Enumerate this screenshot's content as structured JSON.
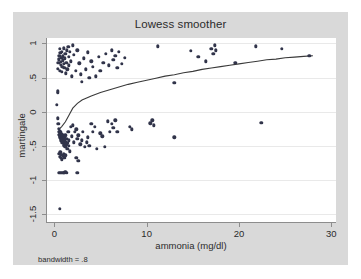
{
  "figure": {
    "title": "Lowess smoother",
    "note": "bandwidth = .8",
    "background_color": "#d9d9d9",
    "plot_background_color": "#ffffff",
    "marker_color": "#31344a",
    "line_color": "#3a3a3a"
  },
  "chart_data": {
    "type": "scatter",
    "title": "Lowess smoother",
    "xlabel": "ammonia (mg/dl)",
    "ylabel": "martingale",
    "annotation": "bandwidth = .8",
    "grid": true,
    "legend": "none",
    "xlim": [
      -0.9,
      30.5
    ],
    "ylim": [
      -1.62,
      1.08
    ],
    "xticks": [
      0,
      10,
      20,
      30
    ],
    "xtick_labels": [
      "0",
      "10",
      "20",
      "30"
    ],
    "yticks": [
      1,
      0.5,
      0,
      -0.5,
      -1,
      -1.5
    ],
    "ytick_labels": [
      "1",
      ".5",
      "0",
      "-.5",
      "-1",
      "-1.5"
    ],
    "series": [
      {
        "name": "martingale residuals",
        "type": "scatter",
        "points": [
          [
            0.35,
            0.3
          ],
          [
            0.4,
            0.63
          ],
          [
            0.45,
            0.72
          ],
          [
            0.5,
            0.77
          ],
          [
            0.55,
            0.82
          ],
          [
            0.6,
            0.6
          ],
          [
            0.62,
            0.92
          ],
          [
            0.65,
            0.86
          ],
          [
            0.7,
            0.69
          ],
          [
            0.72,
            0.73
          ],
          [
            0.75,
            0.79
          ],
          [
            0.8,
            0.88
          ],
          [
            0.82,
            0.58
          ],
          [
            0.85,
            0.66
          ],
          [
            0.9,
            0.75
          ],
          [
            0.95,
            0.81
          ],
          [
            1.0,
            0.93
          ],
          [
            1.05,
            0.7
          ],
          [
            1.1,
            0.64
          ],
          [
            1.15,
            0.78
          ],
          [
            1.2,
            0.85
          ],
          [
            1.25,
            0.56
          ],
          [
            1.3,
            0.72
          ],
          [
            1.35,
            0.9
          ],
          [
            1.4,
            0.62
          ],
          [
            1.5,
            0.95
          ],
          [
            1.55,
            0.8
          ],
          [
            1.6,
            0.68
          ],
          [
            1.7,
            0.88
          ],
          [
            1.8,
            0.74
          ],
          [
            1.9,
            0.52
          ],
          [
            2.0,
            0.97
          ],
          [
            2.1,
            0.83
          ],
          [
            2.3,
            0.6
          ],
          [
            2.5,
            0.9
          ],
          [
            2.7,
            0.71
          ],
          [
            2.9,
            0.55
          ],
          [
            3.0,
            0.44
          ],
          [
            3.2,
            0.78
          ],
          [
            3.4,
            0.62
          ],
          [
            3.6,
            0.87
          ],
          [
            3.8,
            0.5
          ],
          [
            4.0,
            0.74
          ],
          [
            4.2,
            0.66
          ],
          [
            4.5,
            0.52
          ],
          [
            4.8,
            0.8
          ],
          [
            5.0,
            0.6
          ],
          [
            5.3,
            0.72
          ],
          [
            5.6,
            0.85
          ],
          [
            5.9,
            0.68
          ],
          [
            6.2,
            0.9
          ],
          [
            6.4,
            0.76
          ],
          [
            6.6,
            0.82
          ],
          [
            6.8,
            0.64
          ],
          [
            7.0,
            0.88
          ],
          [
            7.3,
            0.7
          ],
          [
            7.6,
            0.79
          ],
          [
            11.2,
            0.96
          ],
          [
            13.0,
            0.42
          ],
          [
            14.8,
            0.89
          ],
          [
            15.6,
            0.8
          ],
          [
            16.4,
            0.74
          ],
          [
            17.0,
            0.92
          ],
          [
            17.2,
            0.85
          ],
          [
            17.4,
            0.97
          ],
          [
            17.5,
            0.9
          ],
          [
            19.6,
            0.72
          ],
          [
            21.8,
            0.96
          ],
          [
            24.6,
            0.92
          ],
          [
            27.6,
            0.82
          ],
          [
            0.3,
            0.1
          ],
          [
            0.35,
            0.28
          ],
          [
            0.4,
            -0.1
          ],
          [
            0.45,
            -0.18
          ],
          [
            0.5,
            -0.25
          ],
          [
            0.52,
            -0.3
          ],
          [
            0.55,
            -0.34
          ],
          [
            0.58,
            -0.28
          ],
          [
            0.6,
            -0.38
          ],
          [
            0.62,
            -0.32
          ],
          [
            0.65,
            -0.36
          ],
          [
            0.68,
            -0.42
          ],
          [
            0.7,
            -0.3
          ],
          [
            0.72,
            -0.35
          ],
          [
            0.75,
            -0.4
          ],
          [
            0.78,
            -0.33
          ],
          [
            0.8,
            -0.45
          ],
          [
            0.82,
            -0.37
          ],
          [
            0.85,
            -0.41
          ],
          [
            0.88,
            -0.34
          ],
          [
            0.9,
            -0.46
          ],
          [
            0.92,
            -0.39
          ],
          [
            0.95,
            -0.43
          ],
          [
            0.98,
            -0.36
          ],
          [
            1.0,
            -0.48
          ],
          [
            1.02,
            -0.4
          ],
          [
            1.05,
            -0.44
          ],
          [
            1.08,
            -0.38
          ],
          [
            1.1,
            -0.5
          ],
          [
            1.12,
            -0.42
          ],
          [
            1.15,
            -0.46
          ],
          [
            1.18,
            -0.35
          ],
          [
            1.2,
            -0.52
          ],
          [
            1.25,
            -0.44
          ],
          [
            1.3,
            -0.48
          ],
          [
            1.35,
            -0.4
          ],
          [
            1.4,
            -0.55
          ],
          [
            1.45,
            -0.46
          ],
          [
            1.5,
            -0.3
          ],
          [
            1.55,
            -0.5
          ],
          [
            1.6,
            -0.42
          ],
          [
            1.7,
            -0.58
          ],
          [
            1.8,
            -0.22
          ],
          [
            1.9,
            -0.36
          ],
          [
            2.0,
            -0.2
          ],
          [
            2.1,
            -0.45
          ],
          [
            2.2,
            -0.3
          ],
          [
            2.4,
            -0.26
          ],
          [
            2.5,
            -0.4
          ],
          [
            2.6,
            -0.35
          ],
          [
            2.8,
            -0.48
          ],
          [
            3.0,
            -0.42
          ],
          [
            3.1,
            -0.3
          ],
          [
            3.3,
            -0.52
          ],
          [
            3.5,
            -0.45
          ],
          [
            3.6,
            -0.38
          ],
          [
            3.8,
            -0.5
          ],
          [
            4.0,
            -0.18
          ],
          [
            4.2,
            -0.3
          ],
          [
            4.4,
            -0.22
          ],
          [
            4.6,
            -0.55
          ],
          [
            5.0,
            -0.32
          ],
          [
            5.2,
            -0.36
          ],
          [
            5.5,
            -0.52
          ],
          [
            5.8,
            -0.14
          ],
          [
            6.0,
            -0.3
          ],
          [
            6.2,
            -0.18
          ],
          [
            6.4,
            -0.24
          ],
          [
            6.6,
            -0.13
          ],
          [
            6.8,
            -0.3
          ],
          [
            8.2,
            -0.22
          ],
          [
            8.4,
            -0.26
          ],
          [
            10.4,
            -0.17
          ],
          [
            10.6,
            -0.13
          ],
          [
            10.8,
            -0.2
          ],
          [
            13.0,
            -0.38
          ],
          [
            22.4,
            -0.16
          ],
          [
            0.55,
            -0.62
          ],
          [
            0.6,
            -0.66
          ],
          [
            0.65,
            -0.6
          ],
          [
            0.7,
            -0.68
          ],
          [
            0.75,
            -0.63
          ],
          [
            0.8,
            -0.7
          ],
          [
            0.9,
            -0.65
          ],
          [
            1.0,
            -0.62
          ],
          [
            1.1,
            -0.68
          ],
          [
            1.2,
            -0.64
          ],
          [
            2.4,
            -0.68
          ],
          [
            2.6,
            -0.72
          ],
          [
            0.5,
            -0.9
          ],
          [
            0.6,
            -0.9
          ],
          [
            0.7,
            -0.9
          ],
          [
            0.8,
            -0.9
          ],
          [
            0.9,
            -0.9
          ],
          [
            1.0,
            -0.9
          ],
          [
            1.1,
            -0.9
          ],
          [
            1.2,
            -0.88
          ],
          [
            1.35,
            -0.9
          ],
          [
            2.5,
            -0.9
          ],
          [
            0.6,
            -1.43
          ]
        ]
      },
      {
        "name": "lowess smooth",
        "type": "line",
        "points": [
          [
            0.5,
            -0.26
          ],
          [
            0.8,
            -0.22
          ],
          [
            1.2,
            -0.15
          ],
          [
            1.6,
            -0.05
          ],
          [
            2.0,
            0.05
          ],
          [
            2.5,
            0.12
          ],
          [
            3.0,
            0.17
          ],
          [
            3.5,
            0.2
          ],
          [
            4.0,
            0.23
          ],
          [
            5.0,
            0.28
          ],
          [
            6.0,
            0.32
          ],
          [
            7.0,
            0.36
          ],
          [
            8.0,
            0.4
          ],
          [
            9.0,
            0.43
          ],
          [
            10.0,
            0.46
          ],
          [
            11.0,
            0.49
          ],
          [
            12.0,
            0.52
          ],
          [
            13.0,
            0.54
          ],
          [
            14.0,
            0.57
          ],
          [
            15.0,
            0.59
          ],
          [
            16.0,
            0.62
          ],
          [
            17.0,
            0.64
          ],
          [
            18.0,
            0.66
          ],
          [
            19.0,
            0.68
          ],
          [
            20.0,
            0.7
          ],
          [
            21.0,
            0.72
          ],
          [
            22.0,
            0.74
          ],
          [
            23.0,
            0.76
          ],
          [
            24.0,
            0.77
          ],
          [
            25.0,
            0.79
          ],
          [
            26.0,
            0.8
          ],
          [
            27.0,
            0.81
          ],
          [
            28.0,
            0.82
          ]
        ]
      }
    ]
  }
}
